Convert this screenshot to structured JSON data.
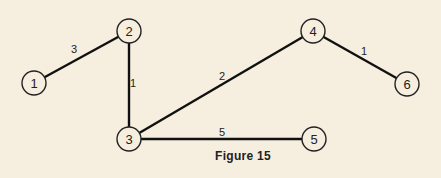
{
  "figure": {
    "caption": "Figure 15",
    "nodes": [
      {
        "id": "1",
        "label": "1",
        "x": 34,
        "y": 83
      },
      {
        "id": "2",
        "label": "2",
        "x": 129,
        "y": 31
      },
      {
        "id": "3",
        "label": "3",
        "x": 129,
        "y": 139
      },
      {
        "id": "4",
        "label": "4",
        "x": 313,
        "y": 31
      },
      {
        "id": "5",
        "label": "5",
        "x": 314,
        "y": 139
      },
      {
        "id": "6",
        "label": "6",
        "x": 407,
        "y": 84
      }
    ],
    "edges": [
      {
        "from": "1",
        "to": "2",
        "weight": "3",
        "lx": 74,
        "ly": 53
      },
      {
        "from": "2",
        "to": "3",
        "weight": "1",
        "lx": 133,
        "ly": 87
      },
      {
        "from": "3",
        "to": "4",
        "weight": "2",
        "lx": 222,
        "ly": 80
      },
      {
        "from": "3",
        "to": "5",
        "weight": "5",
        "lx": 222,
        "ly": 136
      },
      {
        "from": "4",
        "to": "6",
        "weight": "1",
        "lx": 364,
        "ly": 55
      }
    ]
  }
}
